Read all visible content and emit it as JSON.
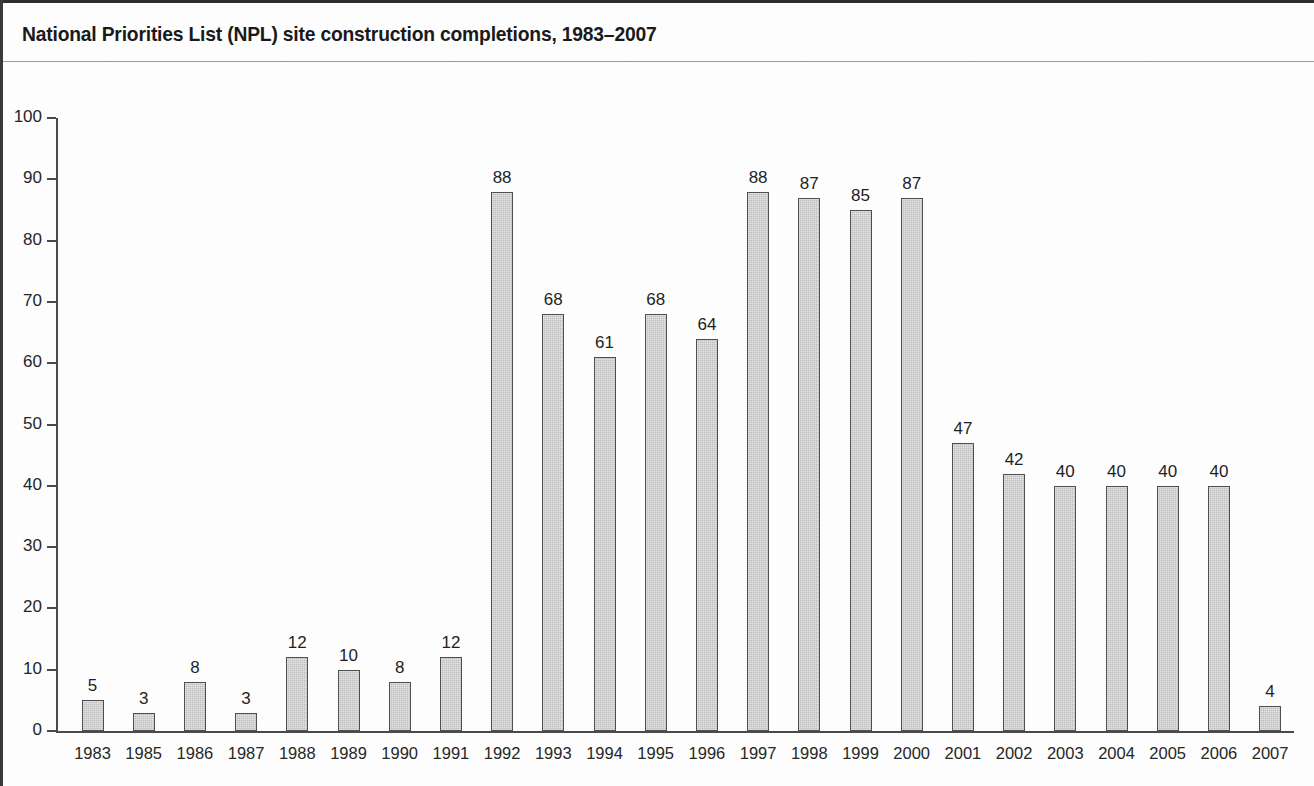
{
  "figure": {
    "title": "National Priorities List (NPL) site construction completions, 1983–2007",
    "axis_color": "#4a4a4a",
    "bar_fill": "#bfbfbf",
    "bar_stroke": "#4f4f4f",
    "text_color": "#262626",
    "background": "#fdfdfd"
  },
  "chart_data": {
    "type": "bar",
    "title": "National Priorities List (NPL) site construction completions, 1983–2007",
    "xlabel": "",
    "ylabel": "",
    "ylim": [
      0,
      100
    ],
    "yticks": [
      0,
      10,
      20,
      30,
      40,
      50,
      60,
      70,
      80,
      90,
      100
    ],
    "ytick_labels": [
      "0",
      "10",
      "20",
      "30",
      "40",
      "50",
      "60",
      "70",
      "80",
      "90",
      "100"
    ],
    "grid": false,
    "legend": false,
    "show_value_labels": true,
    "categories": [
      "1983",
      "1985",
      "1986",
      "1987",
      "1988",
      "1989",
      "1990",
      "1991",
      "1992",
      "1993",
      "1994",
      "1995",
      "1996",
      "1997",
      "1998",
      "1999",
      "2000",
      "2001",
      "2002",
      "2003",
      "2004",
      "2005",
      "2006",
      "2007"
    ],
    "values": [
      5,
      3,
      8,
      3,
      12,
      10,
      8,
      12,
      88,
      68,
      61,
      68,
      64,
      88,
      87,
      85,
      87,
      47,
      42,
      40,
      40,
      40,
      40,
      4
    ],
    "value_labels": [
      "5",
      "3",
      "8",
      "3",
      "12",
      "10",
      "8",
      "12",
      "88",
      "68",
      "61",
      "68",
      "64",
      "88",
      "87",
      "85",
      "87",
      "47",
      "42",
      "40",
      "40",
      "40",
      "40",
      "4"
    ]
  }
}
